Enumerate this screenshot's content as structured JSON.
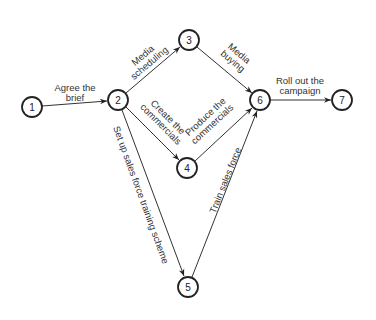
{
  "diagram": {
    "type": "network-activity-diagram",
    "nodes": [
      {
        "id": "1",
        "label": "1",
        "x": 32,
        "y": 107
      },
      {
        "id": "2",
        "label": "2",
        "x": 118,
        "y": 100
      },
      {
        "id": "3",
        "label": "3",
        "x": 189,
        "y": 40
      },
      {
        "id": "4",
        "label": "4",
        "x": 187,
        "y": 168
      },
      {
        "id": "5",
        "label": "5",
        "x": 188,
        "y": 287
      },
      {
        "id": "6",
        "label": "6",
        "x": 260,
        "y": 100
      },
      {
        "id": "7",
        "label": "7",
        "x": 342,
        "y": 100
      }
    ],
    "edges": [
      {
        "from": "1",
        "to": "2",
        "label_lines": [
          "Agree the",
          "brief"
        ]
      },
      {
        "from": "2",
        "to": "3",
        "label_lines": [
          "Media",
          "scheduling"
        ]
      },
      {
        "from": "3",
        "to": "6",
        "label_lines": [
          "Media",
          "buying"
        ]
      },
      {
        "from": "2",
        "to": "4",
        "label_lines": [
          "Create the",
          "commercials"
        ]
      },
      {
        "from": "4",
        "to": "6",
        "label_lines": [
          "Produce the",
          "commercials"
        ]
      },
      {
        "from": "2",
        "to": "5",
        "label_lines": [
          "Set up sales force training scheme"
        ]
      },
      {
        "from": "5",
        "to": "6",
        "label_lines": [
          "Train sales force"
        ]
      },
      {
        "from": "6",
        "to": "7",
        "label_lines": [
          "Roll out the",
          "campaign"
        ]
      }
    ]
  }
}
